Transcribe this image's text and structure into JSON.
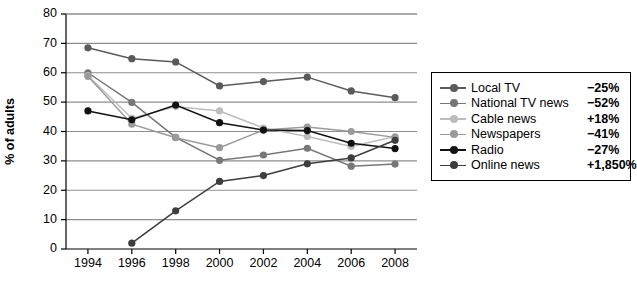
{
  "chart_data": {
    "type": "line",
    "title": "",
    "xlabel": "",
    "ylabel": "% of adults",
    "x": [
      1994,
      1996,
      1998,
      2000,
      2002,
      2004,
      2006,
      2008
    ],
    "xtick_labels": [
      "1994",
      "1996",
      "1998",
      "2000",
      "2002",
      "2004",
      "2006",
      "2008"
    ],
    "ytick_labels": [
      "0",
      "10",
      "20",
      "30",
      "40",
      "50",
      "60",
      "70",
      "80"
    ],
    "xlim": [
      1993,
      2009
    ],
    "ylim": [
      0,
      80
    ],
    "grid": "horizontal",
    "legend_position": "right",
    "series": [
      {
        "name": "Local TV",
        "change": "−25%",
        "color": "#5a5a5a",
        "x": [
          1994,
          1996,
          1998,
          2000,
          2002,
          2004,
          2006,
          2008
        ],
        "values": [
          68.5,
          64.8,
          63.7,
          55.5,
          57.0,
          58.5,
          53.8,
          51.5
        ]
      },
      {
        "name": "National TV news",
        "change": "−52%",
        "color": "#777777",
        "x": [
          1994,
          1996,
          1998,
          2000,
          2002,
          2004,
          2006,
          2008
        ],
        "values": [
          60.0,
          49.9,
          38.0,
          30.2,
          32.0,
          34.3,
          28.2,
          28.9
        ]
      },
      {
        "name": "Cable news",
        "change": "+18%",
        "color": "#bdbdbd",
        "x": [
          1994,
          1996,
          1998,
          2000,
          2002,
          2004,
          2006,
          2008
        ],
        "values": [
          59.0,
          44.5,
          48.5,
          47.0,
          41.2,
          38.3,
          34.9,
          38.3
        ]
      },
      {
        "name": "Newspapers",
        "change": "−41%",
        "color": "#9a9a9a",
        "x": [
          1994,
          1996,
          1998,
          2000,
          2002,
          2004,
          2006,
          2008
        ],
        "values": [
          58.8,
          42.5,
          37.9,
          34.5,
          40.5,
          41.5,
          40.0,
          38.0
        ]
      },
      {
        "name": "Radio",
        "change": "−27%",
        "color": "#121212",
        "x": [
          1994,
          1996,
          1998,
          2000,
          2002,
          2004,
          2006,
          2008
        ],
        "values": [
          47.0,
          44.0,
          49.0,
          43.0,
          40.5,
          40.3,
          36.0,
          34.2
        ]
      },
      {
        "name": "Online news",
        "change": "+1,850%",
        "color": "#3d3d3d",
        "x": [
          1996,
          1998,
          2000,
          2002,
          2004,
          2006,
          2008
        ],
        "values": [
          2.0,
          13.0,
          23.0,
          25.0,
          29.0,
          31.0,
          37.0
        ]
      }
    ]
  }
}
